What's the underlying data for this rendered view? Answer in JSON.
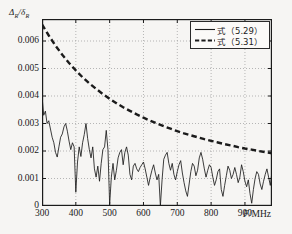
{
  "chart_data": {
    "type": "line",
    "title": "",
    "xlabel": "F/MHz",
    "ylabel": "ΔR/δR",
    "ylabel_parts": {
      "num": "Δ",
      "num_sub": "R",
      "den": "δ",
      "den_sub": "R"
    },
    "xlim": [
      300,
      980
    ],
    "ylim": [
      0,
      0.0068
    ],
    "grid": true,
    "grid_style": "dotted",
    "legend_position": "top-right",
    "xticks": [
      300,
      400,
      500,
      600,
      700,
      800,
      900
    ],
    "xticklabels": [
      "300",
      "400",
      "500",
      "600",
      "700",
      "800",
      "900"
    ],
    "yticks": [
      0,
      0.001,
      0.002,
      0.003,
      0.004,
      0.005,
      0.006
    ],
    "yticklabels": [
      "0",
      "0.001",
      "0.002",
      "0.003",
      "0.004",
      "0.005",
      "0.006"
    ],
    "series": [
      {
        "name": "式（5.29）",
        "style": "solid",
        "color": "#1b1b1b",
        "x": [
          300,
          305,
          310,
          315,
          320,
          325,
          330,
          335,
          340,
          345,
          350,
          355,
          360,
          365,
          370,
          375,
          380,
          385,
          390,
          395,
          400,
          405,
          410,
          415,
          420,
          425,
          430,
          435,
          440,
          445,
          450,
          455,
          460,
          465,
          470,
          475,
          480,
          485,
          490,
          495,
          500,
          505,
          510,
          515,
          520,
          525,
          530,
          535,
          540,
          545,
          550,
          555,
          560,
          565,
          570,
          575,
          580,
          585,
          590,
          595,
          600,
          605,
          610,
          615,
          620,
          625,
          630,
          635,
          640,
          645,
          650,
          655,
          660,
          665,
          670,
          675,
          680,
          685,
          690,
          695,
          700,
          705,
          710,
          715,
          720,
          725,
          730,
          735,
          740,
          745,
          750,
          755,
          760,
          765,
          770,
          775,
          780,
          785,
          790,
          795,
          800,
          805,
          810,
          815,
          820,
          825,
          830,
          835,
          840,
          845,
          850,
          855,
          860,
          865,
          870,
          875,
          880,
          885,
          890,
          895,
          900,
          905,
          910,
          915,
          920,
          925,
          930,
          935,
          940,
          945,
          950,
          955,
          960,
          965,
          970,
          975,
          980
        ],
        "y": [
          0.004,
          0.0033,
          0.00345,
          0.003,
          0.0031,
          0.0028,
          0.0025,
          0.0023,
          0.00195,
          0.00178,
          0.00215,
          0.0025,
          0.00262,
          0.00288,
          0.003,
          0.00272,
          0.00236,
          0.00205,
          0.0023,
          0.00215,
          0.0005,
          0.0016,
          0.00215,
          0.0018,
          0.0023,
          0.0026,
          0.003,
          0.00245,
          0.00205,
          0.00175,
          0.00215,
          0.00135,
          0.00105,
          0.00145,
          0.0009,
          0.00155,
          0.00205,
          0.00215,
          0.00275,
          0.00205,
          5e-05,
          0.00105,
          0.00155,
          0.00095,
          0.0013,
          0.00175,
          0.00195,
          0.00205,
          0.0015,
          0.00195,
          0.00215,
          0.00185,
          0.00115,
          0.00095,
          0.00145,
          0.00155,
          0.00135,
          0.00125,
          0.0014,
          0.0015,
          0.0016,
          0.00135,
          0.00105,
          0.00075,
          0.00105,
          0.0013,
          0.0015,
          0.0012,
          0.00095,
          0.00115,
          0.0,
          0.00095,
          0.0017,
          0.00185,
          0.00195,
          0.00155,
          0.0013,
          0.00155,
          0.00115,
          0.00095,
          0.00125,
          0.0015,
          0.00165,
          0.0012,
          0.00085,
          0.00055,
          0.00035,
          0.0008,
          0.00125,
          0.00155,
          0.00145,
          0.0011,
          0.0013,
          0.00175,
          0.00195,
          0.0017,
          0.00135,
          0.00105,
          0.0013,
          0.0015,
          0.0014,
          0.00105,
          0.00075,
          0.00095,
          0.00125,
          0.00135,
          0.0006,
          0.00035,
          0.00075,
          0.0011,
          0.00145,
          0.0013,
          0.001,
          0.00115,
          0.0014,
          0.00115,
          0.00085,
          0.00105,
          0.0015,
          0.00125,
          0.0009,
          0.0007,
          0.00095,
          0.00045,
          0.0001,
          0.0006,
          0.001,
          0.00125,
          0.00115,
          0.0008,
          0.0006,
          0.0009,
          0.00115,
          0.00135,
          0.00105,
          0.00075,
          0.00125
        ]
      },
      {
        "name": "式（5.31）",
        "style": "dashed",
        "color": "#1b1b1b",
        "x": [
          300,
          320,
          340,
          360,
          380,
          400,
          420,
          440,
          460,
          480,
          500,
          520,
          540,
          560,
          580,
          600,
          620,
          640,
          660,
          680,
          700,
          720,
          740,
          760,
          780,
          800,
          820,
          840,
          860,
          880,
          900,
          920,
          940,
          960,
          980
        ],
        "y": [
          0.0066,
          0.0062,
          0.00583,
          0.0055,
          0.0052,
          0.00493,
          0.00468,
          0.00446,
          0.00426,
          0.00407,
          0.0039,
          0.00374,
          0.00359,
          0.00346,
          0.00333,
          0.00321,
          0.0031,
          0.003,
          0.0029,
          0.00281,
          0.00272,
          0.00264,
          0.00257,
          0.0025,
          0.00243,
          0.00237,
          0.00231,
          0.00225,
          0.0022,
          0.00214,
          0.00209,
          0.00205,
          0.002,
          0.00196,
          0.00192
        ]
      }
    ],
    "legend": [
      {
        "label": "式（5.29）",
        "style": "solid"
      },
      {
        "label": "式（5.31）",
        "style": "dashed"
      }
    ]
  }
}
